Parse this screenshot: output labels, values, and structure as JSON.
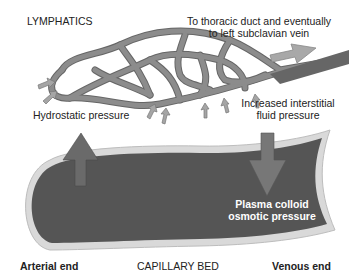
{
  "labels": {
    "lymphatics": "LYMPHATICS",
    "thoracic_line1": "To thoracic duct and eventually",
    "thoracic_line2": "to left subclavian vein",
    "hydrostatic": "Hydrostatic pressure",
    "interstitial_line1": "Increased interstitial",
    "interstitial_line2": "fluid pressure",
    "plasma_line1": "Plasma colloid",
    "plasma_line2": "osmotic pressure",
    "arterial_end": "Arterial end",
    "capillary_bed": "CAPILLARY BED",
    "venous_end": "Venous end"
  },
  "colors": {
    "capillary_fill": "#555555",
    "capillary_wall": "#d6d6d6",
    "lymph_vessel": "#8a8a8a",
    "lymph_outline": "#666666",
    "arrow": "#777777",
    "small_arrow": "#9a9a9a",
    "text": "#222222"
  }
}
